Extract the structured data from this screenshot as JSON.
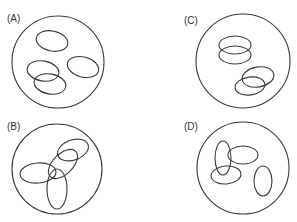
{
  "figure": {
    "stroke_color": "#3a3a3a",
    "panels": [
      {
        "id": "A",
        "label": "(A)",
        "label_pos": [
          7,
          22
        ],
        "circle": {
          "cx": 58,
          "cy": 62,
          "r": 46
        },
        "ellipses": [
          {
            "cx": 52,
            "cy": 41,
            "rx": 16,
            "ry": 10,
            "rot": 12
          },
          {
            "cx": 83,
            "cy": 67,
            "rx": 16,
            "ry": 10,
            "rot": 15
          },
          {
            "cx": 43,
            "cy": 71,
            "rx": 16,
            "ry": 10,
            "rot": 10
          },
          {
            "cx": 50,
            "cy": 84,
            "rx": 16,
            "ry": 10,
            "rot": 10
          }
        ]
      },
      {
        "id": "C",
        "label": "(C)",
        "label_pos": [
          184,
          24
        ],
        "circle": {
          "cx": 243,
          "cy": 61,
          "r": 47
        },
        "ellipses": [
          {
            "cx": 235,
            "cy": 45,
            "rx": 16,
            "ry": 9,
            "rot": 0
          },
          {
            "cx": 235,
            "cy": 55,
            "rx": 16,
            "ry": 9,
            "rot": 0
          },
          {
            "cx": 258,
            "cy": 77,
            "rx": 16,
            "ry": 10,
            "rot": -10
          },
          {
            "cx": 250,
            "cy": 86,
            "rx": 15,
            "ry": 9,
            "rot": -8
          }
        ]
      },
      {
        "id": "B",
        "label": "(B)",
        "label_pos": [
          7,
          130
        ],
        "circle": {
          "cx": 57,
          "cy": 169,
          "r": 45
        },
        "ellipses": [
          {
            "cx": 73,
            "cy": 150,
            "rx": 16,
            "ry": 10,
            "rot": -20
          },
          {
            "cx": 63,
            "cy": 164,
            "rx": 18,
            "ry": 10,
            "rot": -45
          },
          {
            "cx": 38,
            "cy": 173,
            "rx": 18,
            "ry": 10,
            "rot": -5
          },
          {
            "cx": 57,
            "cy": 189,
            "rx": 10,
            "ry": 20,
            "rot": 0
          }
        ]
      },
      {
        "id": "D",
        "label": "(D)",
        "label_pos": [
          184,
          130
        ],
        "circle": {
          "cx": 243,
          "cy": 168,
          "r": 46
        },
        "ellipses": [
          {
            "cx": 223,
            "cy": 158,
            "rx": 8,
            "ry": 17,
            "rot": 0
          },
          {
            "cx": 243,
            "cy": 155,
            "rx": 15,
            "ry": 9,
            "rot": 0
          },
          {
            "cx": 226,
            "cy": 175,
            "rx": 15,
            "ry": 9,
            "rot": -5
          },
          {
            "cx": 263,
            "cy": 181,
            "rx": 9,
            "ry": 15,
            "rot": 0
          }
        ]
      }
    ]
  }
}
